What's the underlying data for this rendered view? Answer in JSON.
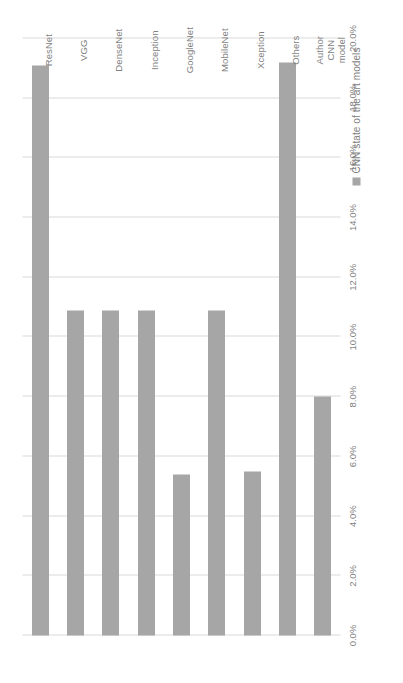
{
  "chart_data": {
    "type": "bar",
    "orientation": "vertical",
    "title": "",
    "xlabel": "",
    "ylabel": "",
    "categories": [
      "ResNet",
      "VGG",
      "DenseNet",
      "Inception",
      "GoogleNet",
      "MobileNet",
      "Xception",
      "Others",
      "Author CNN model"
    ],
    "values": [
      19.1,
      10.9,
      10.9,
      10.9,
      5.4,
      10.9,
      5.5,
      19.2,
      8.0
    ],
    "series": [
      {
        "name": "CNN state of the art models",
        "values": [
          19.1,
          10.9,
          10.9,
          10.9,
          5.4,
          10.9,
          5.5,
          19.2,
          8.0
        ]
      }
    ],
    "ylim": [
      0,
      20
    ],
    "ytick_values": [
      0,
      2,
      4,
      6,
      8,
      10,
      12,
      14,
      16,
      18,
      20
    ],
    "ytick_labels": [
      "0.0%",
      "2.0%",
      "4.0%",
      "6.0%",
      "8.0%",
      "10.0%",
      "12.0%",
      "14.0%",
      "16.0%",
      "18.0%",
      "20.0%"
    ],
    "grid": true,
    "legend_position": "bottom",
    "bar_color": "#a6a6a6",
    "grid_color": "#d9d9d9",
    "text_color": "#7f7f7f"
  },
  "legend": {
    "entries": [
      {
        "label": "CNN state of the art models",
        "color": "#a6a6a6",
        "marker": "square-swatch-icon"
      }
    ]
  }
}
